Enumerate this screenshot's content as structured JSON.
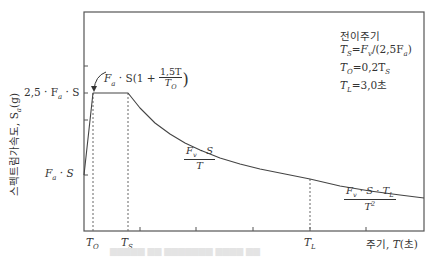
{
  "chart_data": {
    "type": "line",
    "title": "",
    "xlabel": "주기, T(초)",
    "ylabel": "스펙트럼가속도, S_a(g)",
    "x_ticks": [
      "T_O",
      "T_S",
      "T_L"
    ],
    "y_ticks": [
      "2.5·F_a·S",
      "F_a·S"
    ],
    "segments": [
      {
        "name": "ascending",
        "expression": "F_a·S(1 + 1.5T/T_O)",
        "from": "T=0, S_a=F_a·S",
        "to": "T=T_O, S_a=2.5·F_a·S"
      },
      {
        "name": "plateau",
        "expression": "2.5·F_a·S",
        "from": "T_O",
        "to": "T_S"
      },
      {
        "name": "velocity",
        "expression": "F_v·S/T",
        "from": "T_S",
        "to": "T_L"
      },
      {
        "name": "displacement",
        "expression": "F_v·S·T_L/T²",
        "from": "T_L",
        "to": "end"
      }
    ],
    "annotations": [
      "F_a·S(1+1,5T/T_O)",
      "F_v·S/T",
      "F_v·S·T_L/T²"
    ],
    "legend": {
      "title": "전이주기",
      "lines": [
        "T_S = F_v/(2,5F_a)",
        "T_O = 0,2T_S",
        "T_L = 3,0초"
      ]
    },
    "grid": false,
    "geometry": {
      "frame": {
        "left": 84,
        "top": 12,
        "right": 424,
        "bottom": 231
      },
      "x_T0": 93,
      "x_TS": 128,
      "x_TL": 310,
      "x_end": 424,
      "y_plateau": 93,
      "y_FaS": 175,
      "x_minor_ticks": [
        140,
        196,
        253,
        310,
        366
      ],
      "y_minor_ticks": [
        66,
        120
      ]
    },
    "curve_points": [
      [
        93,
        93
      ],
      [
        128,
        93
      ],
      [
        140,
        108
      ],
      [
        155,
        123
      ],
      [
        170,
        134
      ],
      [
        185,
        143
      ],
      [
        200,
        150
      ],
      [
        220,
        158
      ],
      [
        240,
        164
      ],
      [
        260,
        169
      ],
      [
        285,
        174
      ],
      [
        310,
        179
      ],
      [
        340,
        186
      ],
      [
        370,
        191
      ],
      [
        400,
        195
      ],
      [
        424,
        198
      ]
    ]
  },
  "labels": {
    "y_top": "2,5 · F",
    "y_top_sub": "a",
    "y_top_tail": " · S",
    "y_low": "F",
    "y_low_sub": "a",
    "y_low_tail": " · S",
    "ylabel_text": "스펙트럼가속도, S",
    "ylabel_sub": "a",
    "ylabel_tail": "(g)",
    "t0": "T",
    "t0_sub": "O",
    "ts": "T",
    "ts_sub": "S",
    "tl": "T",
    "tl_sub": "L",
    "xlabel_text": "주기, ",
    "xlabel_T": "T",
    "xlabel_tail": "(초)",
    "asc_head": "F",
    "asc_sub": "a",
    "asc_mid": " · S(1 + ",
    "asc_num": "1,5T",
    "asc_den": "T",
    "asc_den_sub": "O",
    "asc_tail": ")",
    "vel_num": "F",
    "vel_num_sub": "v",
    "vel_num_tail": " · S",
    "vel_den": "T",
    "disp_num": "F",
    "disp_num_sub": "v",
    "disp_num_mid": " · S · T",
    "disp_num_sub2": "L",
    "disp_den": "T",
    "disp_den_sup": "2"
  },
  "legend": {
    "title": "전이주기",
    "l1_a": "T",
    "l1_a_sub": "S",
    "l1_b": "=F",
    "l1_b_sub": "v",
    "l1_c": "/(2,5F",
    "l1_c_sub": "a",
    "l1_d": ")",
    "l2_a": "T",
    "l2_a_sub": "O",
    "l2_b": "=0,2T",
    "l2_b_sub": "S",
    "l3_a": "T",
    "l3_a_sub": "L",
    "l3_b": "=3,0초"
  },
  "caption": "▆▆▆▆▆ ▆▆ ▆▆▆▆▆▆▆ ▆▆▆▆ ▆▆"
}
